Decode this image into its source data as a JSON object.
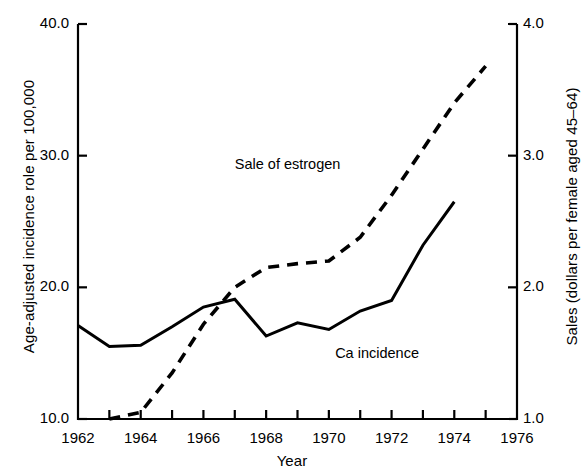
{
  "chart_data": {
    "type": "line",
    "title": "",
    "subtitle": "",
    "xlabel": "Year",
    "ylabel": "Age-adjusted incidence role per 100,000",
    "ylabel_right": "Sales (dollars per female aged 45–64)",
    "grid": false,
    "legend_position": "inline-annotations",
    "xlim": [
      1962,
      1976
    ],
    "xticks": [
      1962,
      1963,
      1964,
      1965,
      1966,
      1967,
      1968,
      1969,
      1970,
      1971,
      1972,
      1973,
      1974,
      1975,
      1976
    ],
    "xtick_labels": [
      "1962",
      "",
      "1964",
      "",
      "1966",
      "",
      "1968",
      "",
      "1970",
      "",
      "1972",
      "",
      "1974",
      "",
      "1976"
    ],
    "ylim_left": [
      10.0,
      40.0
    ],
    "yticks_left": [
      10.0,
      20.0,
      30.0,
      40.0
    ],
    "ytick_labels_left": [
      "10.0",
      "20.0",
      "30.0",
      "40.0"
    ],
    "ylim_right": [
      1.0,
      4.0
    ],
    "yticks_right": [
      1.0,
      2.0,
      3.0,
      4.0
    ],
    "ytick_labels_right": [
      "1.0",
      "2.0",
      "3.0",
      "4.0"
    ],
    "series": [
      {
        "name": "Ca incidence",
        "axis": "left",
        "style": "solid",
        "color": "#000000",
        "x": [
          1962,
          1963,
          1964,
          1965,
          1966,
          1967,
          1968,
          1969,
          1970,
          1971,
          1972,
          1973,
          1974
        ],
        "values": [
          17.1,
          15.5,
          15.6,
          17.0,
          18.5,
          19.1,
          16.3,
          17.3,
          16.8,
          18.2,
          19.0,
          23.2,
          26.5
        ]
      },
      {
        "name": "Sale of estrogen",
        "axis": "right",
        "style": "dashed",
        "color": "#000000",
        "x": [
          1963,
          1964,
          1965,
          1966,
          1967,
          1968,
          1969,
          1970,
          1971,
          1972,
          1973,
          1974,
          1975
        ],
        "values": [
          1.0,
          1.05,
          1.35,
          1.72,
          2.0,
          2.15,
          2.18,
          2.2,
          2.38,
          2.7,
          3.05,
          3.4,
          3.68
        ]
      }
    ],
    "annotations": [
      {
        "text": "Sale of estrogen",
        "x": 1967.0,
        "y_right": 2.92
      },
      {
        "text": "Ca incidence",
        "x": 1970.2,
        "y_left": 14.85
      }
    ]
  }
}
